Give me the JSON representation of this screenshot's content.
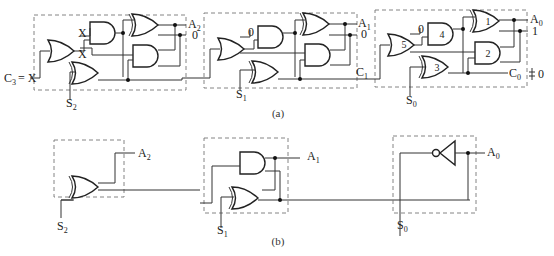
{
  "figure": {
    "caption_a": "(a)",
    "caption_b": "(b)"
  },
  "part_a": {
    "stage2": {
      "input_carry_label": "C",
      "input_carry_sub": "3",
      "input_carry_value": "= X",
      "select_label": "S",
      "select_sub": "2",
      "internal_labels": [
        "X",
        "X"
      ],
      "output_label": "A",
      "output_sub": "2",
      "output_zero": "0"
    },
    "stage1": {
      "select_label": "S",
      "select_sub": "1",
      "internal_label": "0",
      "output_label": "A",
      "output_sub": "1",
      "output_zero": "0",
      "carry_label": "C",
      "carry_sub": "1"
    },
    "stage0": {
      "select_label": "S",
      "select_sub": "0",
      "internal_label": "0",
      "output_label": "A",
      "output_sub": "0",
      "output_one": "1",
      "carry_label": "C",
      "carry_sub": "0",
      "carry_value": "0",
      "gate_numbers": [
        "1",
        "2",
        "3",
        "4",
        "5"
      ]
    }
  },
  "part_b": {
    "stage2": {
      "select_label": "S",
      "select_sub": "2",
      "output_label": "A",
      "output_sub": "2"
    },
    "stage1": {
      "select_label": "S",
      "select_sub": "1",
      "output_label": "A",
      "output_sub": "1"
    },
    "stage0": {
      "select_label": "S",
      "select_sub": "0",
      "output_label": "A",
      "output_sub": "0"
    }
  }
}
